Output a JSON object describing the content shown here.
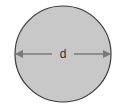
{
  "diagram": {
    "type": "circle-diameter",
    "circle": {
      "center_x": 63,
      "center_y": 54,
      "radius": 48,
      "fill": "#c8c8c8",
      "stroke": "#3a3a3a"
    },
    "arrow": {
      "style": "double-headed",
      "color": "#7a7a7a",
      "label": "d"
    }
  }
}
